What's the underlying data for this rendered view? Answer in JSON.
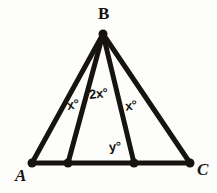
{
  "figure": {
    "stroke_color": "#17140f",
    "background_color": "#fdfdfb",
    "stroke_width": 5,
    "dot_radius": 4.5
  },
  "vertices": {
    "B": {
      "label": "B",
      "x": 103,
      "y": 34
    },
    "A": {
      "label": "A",
      "x": 32,
      "y": 163
    },
    "C": {
      "label": "C",
      "x": 190,
      "y": 163
    },
    "D": {
      "label": "",
      "x": 68,
      "y": 163
    },
    "E": {
      "label": "",
      "x": 134,
      "y": 163
    }
  },
  "segments": [
    {
      "name": "BA",
      "from": "B",
      "to": "A"
    },
    {
      "name": "BD",
      "from": "B",
      "to": "D"
    },
    {
      "name": "BE",
      "from": "B",
      "to": "E"
    },
    {
      "name": "BC",
      "from": "B",
      "to": "C"
    },
    {
      "name": "AC",
      "from": "A",
      "to": "C"
    }
  ],
  "angle_labels": {
    "abd": "x°",
    "dbe": "2x°",
    "ebc": "x°",
    "bea": "y°"
  },
  "vertex_labels": {
    "b": "B",
    "a": "A",
    "c": "C"
  }
}
